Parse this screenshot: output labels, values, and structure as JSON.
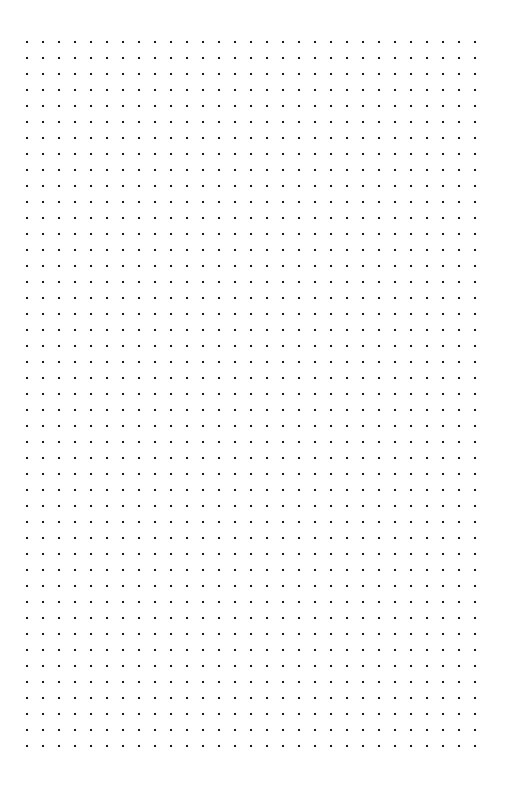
{
  "page": {
    "name": "dot-grid-page",
    "width": 505,
    "height": 791,
    "background_color": "#ffffff",
    "content_text": "",
    "title": ""
  },
  "grid": {
    "label": "dot grid",
    "dot_color": "#1a1a1a",
    "dot_size_px": 2,
    "spacing_px": 16,
    "columns": 29,
    "rows": 45,
    "origin_x": 27,
    "origin_y": 42,
    "margin_left_px": 27,
    "margin_top_px": 42,
    "margin_right_px": 30,
    "margin_bottom_px": 45,
    "total_dots": 1305
  }
}
